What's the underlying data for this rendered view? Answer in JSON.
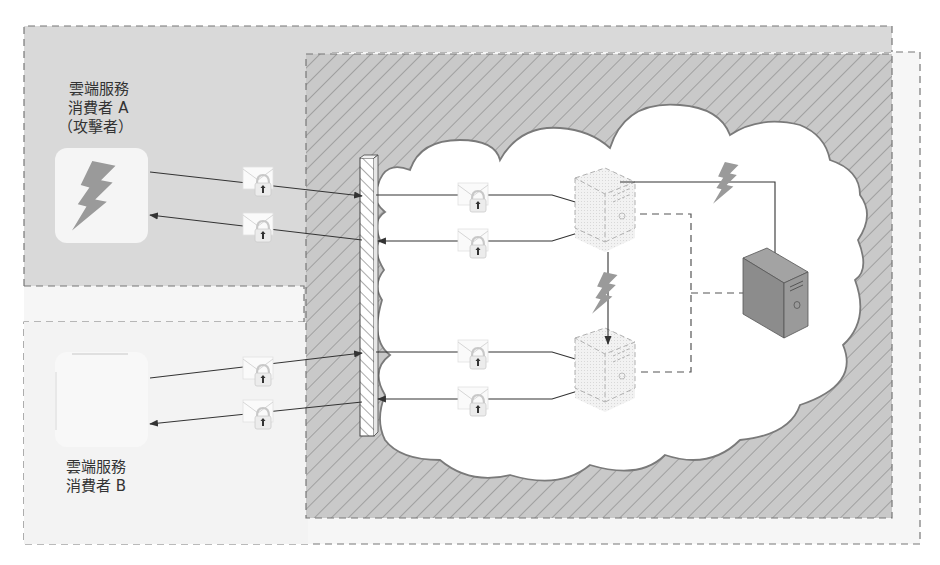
{
  "colors": {
    "consumer_a_bg": "#d9d9d9",
    "consumer_b_bg": "#f3f3f3",
    "outer_bg": "#f6f6f6",
    "hatch_bg": "#c9c9c9",
    "hatch_line": "#8a8a8a",
    "cloud_fill": "#ffffff",
    "cloud_stroke": "#7a7a7a",
    "dash_stroke": "#666666",
    "line": "#333333",
    "bolt": "#9a9a9a",
    "server_dark": "#8c8c8c",
    "text": "#333333"
  },
  "consumer_a": {
    "label_line1": "雲端服務",
    "label_line2": "消費者 A",
    "label_line3": "（攻擊者）",
    "icon": "lightning-bolt-icon"
  },
  "consumer_b": {
    "label_line1": "雲端服務",
    "label_line2": "消費者 B",
    "icon": "blank-app-icon"
  },
  "cloud": {
    "firewall": "firewall-icon",
    "virtual_server_top": "virtual-server-icon",
    "virtual_server_bottom": "virtual-server-icon",
    "physical_server": "physical-server-icon"
  },
  "messages": {
    "icon": "encrypted-message-icon",
    "count": 8
  }
}
